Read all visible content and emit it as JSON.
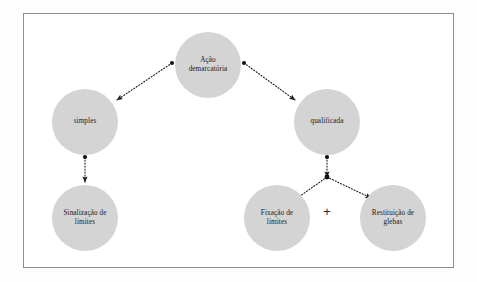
{
  "figure": {
    "kind": "tree-diagram",
    "frame": {
      "stroke": "#8d8d8d"
    },
    "background": "#ffffff",
    "node_fill": "#d4d4d4",
    "connector_color": "#222222",
    "plus_symbol": "+"
  },
  "nodes": [
    {
      "id": "acao-demarcatoria",
      "label": "Ação\ndemarcatória",
      "cx": 208,
      "cy": 65,
      "r": 33,
      "level": 0
    },
    {
      "id": "simples",
      "label": "simples",
      "cx": 85,
      "cy": 122,
      "r": 33,
      "level": 1
    },
    {
      "id": "qualificada",
      "label": "qualificada",
      "cx": 327,
      "cy": 122,
      "r": 33,
      "level": 1
    },
    {
      "id": "sinalizacao-de-limites",
      "label": "Sinalização de\nlimites",
      "cx": 85,
      "cy": 218,
      "r": 33,
      "level": 2
    },
    {
      "id": "fixacao-de-limites",
      "label": "Fixação de\nlimites",
      "cx": 277,
      "cy": 218,
      "r": 33,
      "level": 2
    },
    {
      "id": "restituicao-de-glebas",
      "label": "Restituição de\nglebas",
      "cx": 393,
      "cy": 218,
      "r": 33,
      "level": 2
    }
  ],
  "connectors": [
    {
      "id": "acao-to-simples",
      "from": "acao-demarcatoria",
      "to": "simples",
      "style": "dotted",
      "x1": 172,
      "y1": 63,
      "x2": 117,
      "y2": 100
    },
    {
      "id": "acao-to-qualificada",
      "from": "acao-demarcatoria",
      "to": "qualificada",
      "style": "dotted",
      "x1": 244,
      "y1": 63,
      "x2": 295,
      "y2": 100
    },
    {
      "id": "simples-to-sinalizacao",
      "from": "simples",
      "to": "sinalizacao-de-limites",
      "style": "dotted",
      "x1": 85,
      "y1": 157,
      "x2": 85,
      "y2": 182
    },
    {
      "id": "qualificada-to-junction",
      "from": "qualificada",
      "to": "junction",
      "style": "dotted",
      "x1": 327,
      "y1": 157,
      "x2": 327,
      "y2": 177
    },
    {
      "id": "junction-to-fixacao",
      "from": "junction",
      "to": "fixacao-de-limites",
      "style": "dotted",
      "x1": 327,
      "y1": 177,
      "x2": 296,
      "y2": 199
    },
    {
      "id": "junction-to-restituicao",
      "from": "junction",
      "to": "restituicao-de-glebas",
      "style": "dotted",
      "x1": 327,
      "y1": 177,
      "x2": 371,
      "y2": 198
    }
  ],
  "junction": {
    "id": "qualificada-junction",
    "cx": 327,
    "cy": 177
  },
  "plus_marker": {
    "symbol": "+",
    "x": 327,
    "y": 211
  }
}
